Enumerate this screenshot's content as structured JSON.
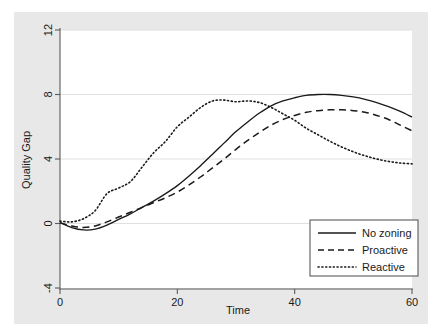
{
  "chart_data": {
    "type": "line",
    "title": "",
    "xlabel": "Time",
    "ylabel": "Quality Gap",
    "xlim": [
      0,
      60
    ],
    "ylim": [
      -4,
      12
    ],
    "xticks": [
      0,
      20,
      40,
      60
    ],
    "yticks": [
      -4,
      0,
      4,
      8,
      12
    ],
    "xtick_labels": [
      "0",
      "20",
      "40",
      "60"
    ],
    "ytick_labels": [
      "-4",
      "0",
      "4",
      "8",
      "12"
    ],
    "grid": "horizontal-faint",
    "legend_position": "lower-right",
    "series": [
      {
        "name": "No zoning",
        "style": "solid",
        "color": "#1a1a1a",
        "x": [
          0,
          2,
          4,
          6,
          8,
          10,
          12,
          14,
          16,
          18,
          20,
          22,
          24,
          26,
          28,
          30,
          32,
          34,
          36,
          38,
          40,
          42,
          44,
          46,
          48,
          50,
          52,
          54,
          56,
          58,
          60
        ],
        "y": [
          0.05,
          -0.25,
          -0.4,
          -0.35,
          -0.1,
          0.25,
          0.6,
          1.0,
          1.4,
          1.85,
          2.35,
          2.95,
          3.6,
          4.3,
          5.0,
          5.7,
          6.3,
          6.85,
          7.3,
          7.6,
          7.8,
          7.95,
          8.0,
          8.0,
          7.95,
          7.85,
          7.7,
          7.5,
          7.25,
          6.95,
          6.6
        ]
      },
      {
        "name": "Proactive",
        "style": "dashed",
        "color": "#1a1a1a",
        "x": [
          0,
          2,
          4,
          6,
          8,
          10,
          12,
          14,
          16,
          18,
          20,
          22,
          24,
          26,
          28,
          30,
          32,
          34,
          36,
          38,
          40,
          42,
          44,
          46,
          48,
          50,
          52,
          54,
          56,
          58,
          60
        ],
        "y": [
          0.05,
          -0.15,
          -0.25,
          -0.15,
          0.1,
          0.4,
          0.7,
          1.0,
          1.3,
          1.6,
          1.95,
          2.4,
          2.9,
          3.45,
          4.0,
          4.6,
          5.15,
          5.65,
          6.1,
          6.45,
          6.7,
          6.9,
          7.0,
          7.05,
          7.05,
          7.0,
          6.9,
          6.7,
          6.45,
          6.1,
          5.75
        ]
      },
      {
        "name": "Reactive",
        "style": "dotted",
        "color": "#1a1a1a",
        "x": [
          0,
          2,
          4,
          6,
          8,
          10,
          12,
          14,
          16,
          18,
          20,
          22,
          24,
          26,
          28,
          30,
          32,
          34,
          36,
          38,
          40,
          42,
          44,
          46,
          48,
          50,
          52,
          54,
          56,
          58,
          60
        ],
        "y": [
          0.15,
          0.1,
          0.3,
          0.8,
          1.85,
          2.2,
          2.6,
          3.5,
          4.4,
          5.1,
          6.0,
          6.6,
          7.2,
          7.6,
          7.65,
          7.55,
          7.6,
          7.5,
          7.2,
          6.8,
          6.4,
          5.9,
          5.5,
          5.1,
          4.75,
          4.45,
          4.2,
          4.0,
          3.85,
          3.75,
          3.7
        ]
      }
    ]
  },
  "legend": {
    "items": [
      {
        "label": "No zoning",
        "style": "solid"
      },
      {
        "label": "Proactive",
        "style": "dashed"
      },
      {
        "label": "Reactive",
        "style": "dotted"
      }
    ]
  },
  "colors": {
    "figure_background": "#ffffff",
    "graph_background": "#e8e8e8",
    "plot_background": "#ffffff",
    "line": "#1a1a1a",
    "axis": "#5a5a5a",
    "grid": "#dcdcdc"
  }
}
